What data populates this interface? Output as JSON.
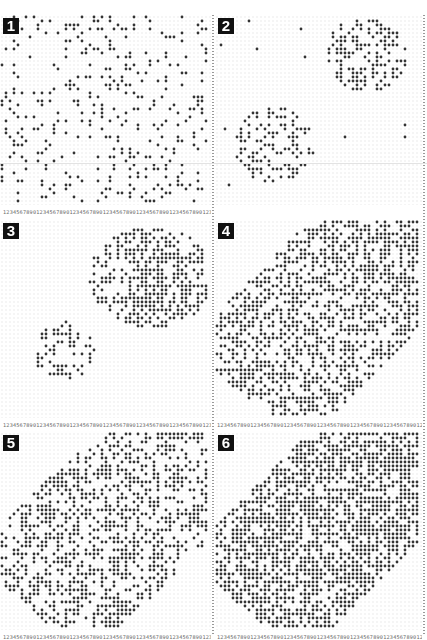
{
  "figure": {
    "dot_color": "#333333",
    "badge_color": "#111111",
    "tick_label_pattern": "1234567890123456789012345678901234567890123456789012345678901234567890",
    "panels": [
      {
        "id": 1,
        "label": "1",
        "x": 0,
        "y": 15,
        "w": 211,
        "h": 190,
        "pattern": "uniform",
        "density": 0.16,
        "seed": 11
      },
      {
        "id": 2,
        "label": "2",
        "x": 215,
        "y": 15,
        "w": 207,
        "h": 190,
        "pattern": "two-clusters-sparse",
        "density": 0.5,
        "seed": 23
      },
      {
        "id": 3,
        "label": "3",
        "x": 0,
        "y": 220,
        "w": 211,
        "h": 198,
        "pattern": "two-clusters-dense",
        "density": 0.55,
        "seed": 37
      },
      {
        "id": 4,
        "label": "4",
        "x": 215,
        "y": 220,
        "w": 207,
        "h": 198,
        "pattern": "diagonal-band",
        "density": 0.55,
        "seed": 41
      },
      {
        "id": 5,
        "label": "5",
        "x": 0,
        "y": 432,
        "w": 211,
        "h": 198,
        "pattern": "diagonal-band",
        "density": 0.45,
        "seed": 53
      },
      {
        "id": 6,
        "label": "6",
        "x": 215,
        "y": 432,
        "w": 207,
        "h": 198,
        "pattern": "diagonal-band",
        "density": 0.68,
        "seed": 67
      }
    ],
    "tick_rows": [
      {
        "x": 3,
        "y": 208,
        "w": 208
      },
      {
        "x": 3,
        "y": 421,
        "w": 208
      },
      {
        "x": 217,
        "y": 421,
        "w": 205
      },
      {
        "x": 3,
        "y": 633,
        "w": 208
      },
      {
        "x": 217,
        "y": 633,
        "w": 205
      }
    ]
  }
}
